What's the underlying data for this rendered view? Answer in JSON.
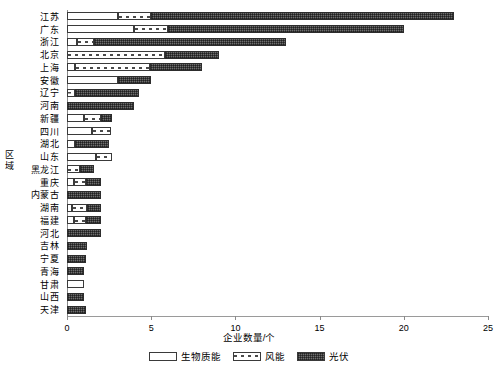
{
  "chart_data": {
    "type": "bar",
    "orientation": "horizontal",
    "stacked": true,
    "title": "",
    "xlabel": "企业数量/个",
    "ylabel": "区域",
    "xlim": [
      0,
      25
    ],
    "xticks": [
      0,
      5,
      10,
      15,
      20,
      25
    ],
    "xticklabels": [
      "0",
      "5",
      "10",
      "15",
      "20",
      "25"
    ],
    "grid": false,
    "legend_position": "bottom-center",
    "categories": [
      "江苏",
      "广东",
      "浙江",
      "北京",
      "上海",
      "安徽",
      "辽宁",
      "河南",
      "新疆",
      "四川",
      "湖北",
      "山东",
      "黑龙江",
      "重庆",
      "内蒙古",
      "湖南",
      "福建",
      "河北",
      "吉林",
      "宁夏",
      "青海",
      "甘肃",
      "山西",
      "天津"
    ],
    "series": [
      {
        "name": "生物质能",
        "fill": "white",
        "values": [
          3.0,
          4.0,
          0.6,
          0.0,
          0.5,
          3.0,
          0.0,
          0.0,
          1.0,
          1.5,
          0.5,
          1.7,
          0.0,
          0.4,
          0.0,
          0.3,
          0.4,
          0.0,
          0.0,
          0.0,
          0.0,
          1.0,
          0.0,
          0.0
        ]
      },
      {
        "name": "风能",
        "fill": "hatched",
        "values": [
          2.0,
          2.0,
          1.0,
          5.8,
          4.4,
          0.0,
          0.5,
          0.0,
          1.0,
          1.1,
          0.0,
          1.0,
          0.8,
          0.7,
          0.0,
          0.9,
          0.7,
          0.0,
          0.0,
          0.0,
          0.0,
          0.0,
          0.0,
          0.0
        ]
      },
      {
        "name": "光伏",
        "fill": "dark",
        "values": [
          18.0,
          14.0,
          11.4,
          3.2,
          3.1,
          2.0,
          3.8,
          4.0,
          0.7,
          0.0,
          2.0,
          0.0,
          0.8,
          0.9,
          2.0,
          0.8,
          0.9,
          2.0,
          1.2,
          1.1,
          1.0,
          0.0,
          1.0,
          1.1
        ]
      }
    ],
    "totals": [
      23.0,
      20.0,
      13.0,
      9.0,
      8.0,
      5.0,
      4.3,
      4.0,
      2.7,
      2.6,
      2.5,
      2.7,
      1.6,
      2.0,
      2.0,
      2.0,
      2.0,
      2.0,
      1.2,
      1.1,
      1.0,
      1.0,
      1.0,
      1.1
    ]
  },
  "legend": {
    "items": [
      {
        "label": "生物质能"
      },
      {
        "label": "风能"
      },
      {
        "label": "光伏"
      }
    ]
  },
  "axis": {
    "x_title": "企业数量/个",
    "y_title_chars": [
      "区",
      "域"
    ]
  },
  "colors": {
    "dark_series": "#6e6e6e",
    "outline": "#3a3a3a",
    "axis": "#8a8a8a"
  }
}
